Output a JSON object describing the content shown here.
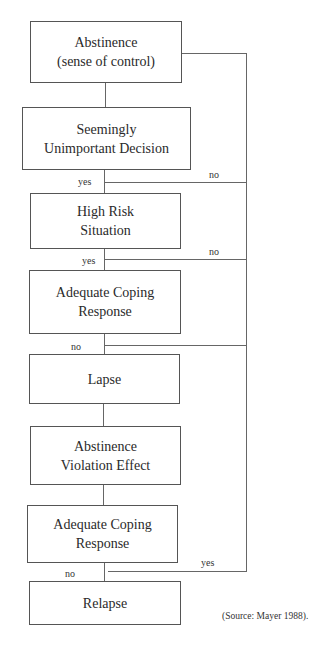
{
  "diagram": {
    "type": "flowchart",
    "nodes": [
      {
        "id": "n1",
        "label": "Abstinence\n(sense of control)"
      },
      {
        "id": "n2",
        "label": "Seemingly\nUnimportant Decision"
      },
      {
        "id": "n3",
        "label": "High Risk\nSituation"
      },
      {
        "id": "n4",
        "label": "Adequate Coping\nResponse"
      },
      {
        "id": "n5",
        "label": "Lapse"
      },
      {
        "id": "n6",
        "label": "Abstinence\nViolation Effect"
      },
      {
        "id": "n7",
        "label": "Adequate Coping\nResponse"
      },
      {
        "id": "n8",
        "label": "Relapse"
      }
    ],
    "edges": [
      {
        "from": "n1",
        "to": "n2",
        "label": ""
      },
      {
        "from": "n2",
        "to": "n3",
        "label": "yes"
      },
      {
        "from": "n2",
        "to": "n1",
        "label": "no"
      },
      {
        "from": "n3",
        "to": "n4",
        "label": "yes"
      },
      {
        "from": "n3",
        "to": "n1",
        "label": "no"
      },
      {
        "from": "n4",
        "to": "n5",
        "label": "no"
      },
      {
        "from": "n5",
        "to": "n6",
        "label": ""
      },
      {
        "from": "n6",
        "to": "n7",
        "label": ""
      },
      {
        "from": "n7",
        "to": "n8",
        "label": "no"
      },
      {
        "from": "n7",
        "to": "n1",
        "label": "yes"
      }
    ],
    "edge_labels": {
      "n2_yes": "yes",
      "n2_no": "no",
      "n3_yes": "yes",
      "n3_no": "no",
      "n4_no": "no",
      "n7_yes": "yes",
      "n7_no": "no"
    },
    "source": "(Source: Mayer 1988)."
  }
}
